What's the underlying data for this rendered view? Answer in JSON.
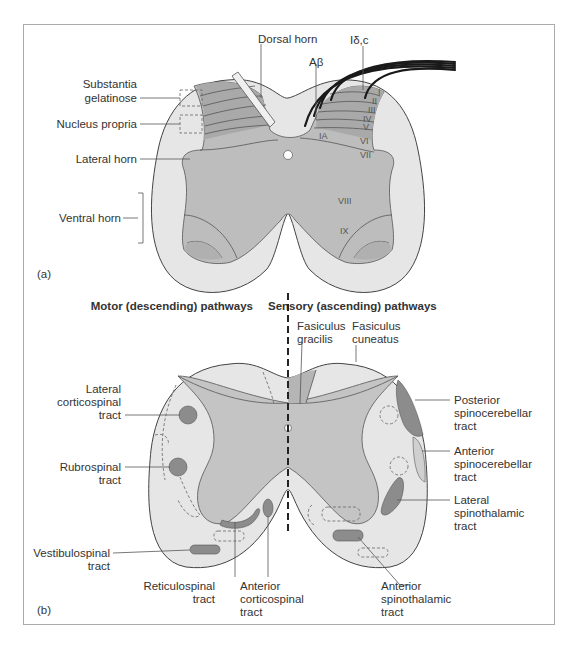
{
  "colors": {
    "frame": "#aaaaaa",
    "white_matter": "#e6e6e6",
    "gray_matter": "#bdbdbd",
    "laminae_dark": "#a9a9a9",
    "tract_fill": "#8c8c8c",
    "canal": "#ffffff",
    "text": "#333333"
  },
  "panel_a": {
    "tag": "(a)",
    "labels": {
      "dorsal_horn": "Dorsal horn",
      "fiber_small": "Iδ,c",
      "fiber_large": "Aβ",
      "substantia_line1": "Substantia",
      "substantia_line2": "gelatinose",
      "nucleus_propria": "Nucleus propria",
      "lateral_horn": "Lateral horn",
      "ventral_horn": "Ventral horn"
    },
    "laminae": [
      "I",
      "II",
      "III",
      "IV",
      "V",
      "VI",
      "VII",
      "VIII",
      "IX",
      "IA"
    ]
  },
  "panel_b": {
    "tag": "(b)",
    "headings": {
      "motor": "Motor (descending) pathways",
      "sensory": "Sensory (ascending) pathways"
    },
    "left_tracts": [
      {
        "lines": [
          "Lateral",
          "corticospinal",
          "tract"
        ]
      },
      {
        "lines": [
          "Rubrospinal",
          "tract"
        ]
      },
      {
        "lines": [
          "Vestibulospinal",
          "tract"
        ]
      },
      {
        "lines": [
          "Reticulospinal",
          "tract"
        ]
      },
      {
        "lines": [
          "Anterior",
          "corticospinal",
          "tract"
        ]
      }
    ],
    "right_tracts": [
      {
        "lines": [
          "Fasiculus",
          "gracilis"
        ]
      },
      {
        "lines": [
          "Fasiculus",
          "cuneatus"
        ]
      },
      {
        "lines": [
          "Posterior",
          "spinocerebellar",
          "tract"
        ]
      },
      {
        "lines": [
          "Anterior",
          "spinocerebellar",
          "tract"
        ]
      },
      {
        "lines": [
          "Lateral",
          "spinothalamic",
          "tract"
        ]
      },
      {
        "lines": [
          "Anterior",
          "spinothalamic",
          "tract"
        ]
      }
    ]
  }
}
